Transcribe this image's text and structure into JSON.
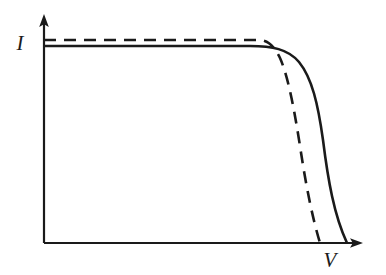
{
  "figure": {
    "type": "line-diagram",
    "background_color": "#ffffff",
    "line_color": "#1a1a1a",
    "width": 386,
    "height": 275
  },
  "axes": {
    "y_label": "I",
    "x_label": "V",
    "y_axis": {
      "x": 44,
      "top_y": 15,
      "bottom_y": 243,
      "arrow": "up"
    },
    "x_axis": {
      "y": 243,
      "left_x": 44,
      "right_x": 362,
      "arrow": "right"
    },
    "y_label_pos": {
      "x": 20,
      "y": 50
    },
    "x_label_pos": {
      "x": 322,
      "y": 267
    },
    "ticks": [],
    "gridlines": false
  },
  "chart_data": {
    "type": "line",
    "xlabel": "V",
    "ylabel": "I",
    "xlim": [
      0,
      1
    ],
    "ylim": [
      0,
      1
    ],
    "grid": false,
    "legend": "none",
    "series": [
      {
        "name": "solid-curve",
        "style": "solid",
        "color": "#1a1a1a",
        "width": 2.6,
        "description": "Higher fill factor: flat plateau with rounded knee, drops to axis further right",
        "path": "M 44,46 L 250,46 C 272,46 288,49 299,62 C 312,78 318,104 323,140 C 328,180 334,215 347,243",
        "points": [
          {
            "x": 44,
            "y": 46
          },
          {
            "x": 150,
            "y": 46
          },
          {
            "x": 250,
            "y": 46
          },
          {
            "x": 285,
            "y": 50
          },
          {
            "x": 305,
            "y": 70
          },
          {
            "x": 318,
            "y": 120
          },
          {
            "x": 330,
            "y": 180
          },
          {
            "x": 347,
            "y": 243
          }
        ]
      },
      {
        "name": "dashed-curve",
        "style": "dashed",
        "color": "#1a1a1a",
        "width": 2.6,
        "dash_pattern": "12 8",
        "description": "Lower fill factor: sharper knee, drops to axis earlier",
        "path": "M 44,40 L 258,40 C 268,40 274,46 280,58 C 288,76 294,108 300,146 C 306,186 312,216 320,243",
        "points": [
          {
            "x": 44,
            "y": 40
          },
          {
            "x": 150,
            "y": 40
          },
          {
            "x": 258,
            "y": 40
          },
          {
            "x": 275,
            "y": 52
          },
          {
            "x": 288,
            "y": 82
          },
          {
            "x": 300,
            "y": 146
          },
          {
            "x": 310,
            "y": 195
          },
          {
            "x": 320,
            "y": 243
          }
        ]
      }
    ]
  }
}
